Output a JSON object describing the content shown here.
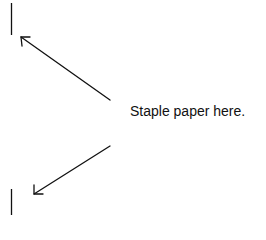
{
  "instruction": {
    "text": "Staple paper here."
  },
  "marks": {
    "top_line": {
      "x": 11.5,
      "y1": 3,
      "y2": 35
    },
    "bottom_line": {
      "x": 11.5,
      "y1": 189,
      "y2": 215
    },
    "top_arrow": {
      "from": [
        110,
        100
      ],
      "to": [
        21,
        37
      ],
      "icon": "arrow-up-left-icon"
    },
    "bottom_arrow": {
      "from": [
        110,
        146
      ],
      "to": [
        34,
        194
      ],
      "icon": "arrow-down-left-icon"
    }
  },
  "colors": {
    "ink": "#111111",
    "background": "#ffffff"
  }
}
